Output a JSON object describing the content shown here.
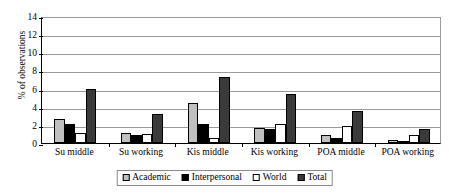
{
  "chart_data": {
    "type": "bar",
    "title": "",
    "xlabel": "",
    "ylabel": "% of observations",
    "ylim": [
      0,
      14
    ],
    "yticks": [
      0,
      2,
      4,
      6,
      8,
      10,
      12,
      14
    ],
    "grid": true,
    "legend_position": "bottom",
    "categories": [
      "Su middle",
      "Su working",
      "Kis middle",
      "Kis working",
      "POA middle",
      "POA working"
    ],
    "series": [
      {
        "name": "Academic",
        "color": "#c0c0c0",
        "values": [
          2.6,
          1.15,
          4.45,
          1.65,
          0.9,
          0.3
        ]
      },
      {
        "name": "Interpersonal",
        "color": "#000000",
        "values": [
          2.1,
          0.85,
          2.15,
          1.55,
          0.5,
          0.15
        ]
      },
      {
        "name": "World",
        "color": "#ffffff",
        "values": [
          1.15,
          0.95,
          0.6,
          2.1,
          1.9,
          0.9
        ]
      },
      {
        "name": "Total",
        "color": "#3a3a3a",
        "values": [
          5.95,
          3.2,
          7.3,
          5.45,
          3.5,
          1.5
        ]
      }
    ]
  }
}
